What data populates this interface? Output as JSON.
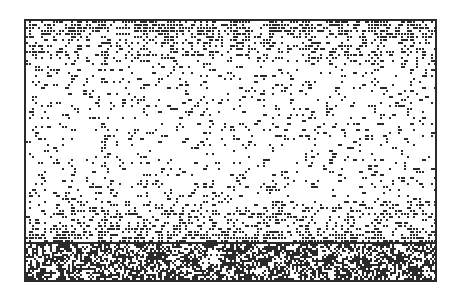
{
  "image": {
    "description": "Dithered dot texture panel with dense patterned band",
    "colors": {
      "ink": "#2a2a2a",
      "paper": "#ffffff"
    },
    "upper_panel": {
      "pattern": "dithered-dots-gradient",
      "density_top": 0.55,
      "density_middle": 0.12,
      "density_bottom": 0.5
    },
    "lower_band": {
      "pattern": "dense-glyph-texture",
      "density": 0.55
    }
  }
}
